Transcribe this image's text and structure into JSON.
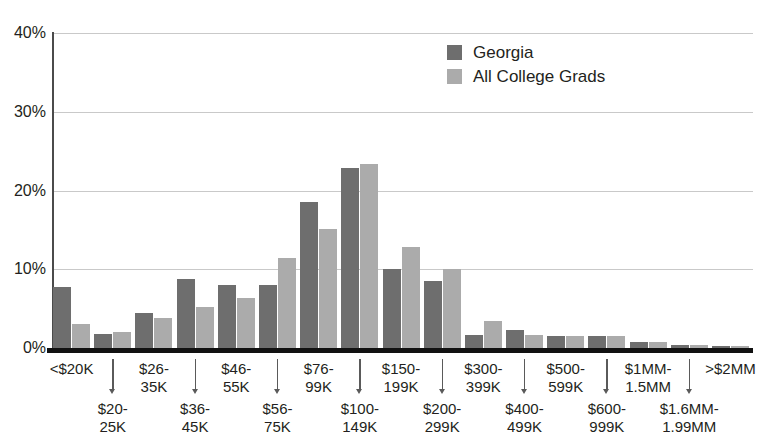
{
  "chart_data": {
    "type": "bar",
    "title": "",
    "subtitle": "",
    "xlabel": "",
    "ylabel": "",
    "ylim": [
      0,
      40
    ],
    "ytick_labels": [
      "40%",
      "30%",
      "20%",
      "10%",
      "0%"
    ],
    "ytick_values": [
      40,
      30,
      20,
      10,
      0
    ],
    "grid": "horizontal",
    "legend_position": "top-right",
    "categories": [
      "<$20K",
      "$20-\n25K",
      "$26-\n35K",
      "$36-\n45K",
      "$46-\n55K",
      "$56-\n75K",
      "$76-\n99K",
      "$100-\n149K",
      "$150-\n199K",
      "$200-\n299K",
      "$300-\n399K",
      "$400-\n499K",
      "$500-\n599K",
      "$600-\n999K",
      "$1MM-\n1.5MM",
      "$1.6MM-\n1.99MM",
      ">$2MM"
    ],
    "series": [
      {
        "name": "Georgia",
        "color": "#6e6e6e",
        "values": [
          7.7,
          1.8,
          4.5,
          8.8,
          8.0,
          8.0,
          18.5,
          22.9,
          10.0,
          8.5,
          1.6,
          2.3,
          1.5,
          1.5,
          0.8,
          0.4,
          0.3
        ]
      },
      {
        "name": "All College Grads",
        "color": "#ababab",
        "values": [
          3.1,
          2.0,
          3.8,
          5.2,
          6.3,
          11.4,
          15.1,
          23.4,
          12.8,
          10.0,
          3.4,
          1.6,
          1.5,
          1.5,
          0.8,
          0.4,
          0.3
        ]
      }
    ]
  },
  "legend": {
    "items": [
      {
        "label": "Georgia",
        "color": "#6e6e6e"
      },
      {
        "label": "All College Grads",
        "color": "#ababab"
      }
    ]
  },
  "colors": {
    "series_dark": "#6e6e6e",
    "series_light": "#ababab",
    "gridline": "#c9c9c9",
    "axis": "#111111",
    "text": "#231f20"
  }
}
